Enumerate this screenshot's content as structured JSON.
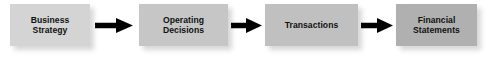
{
  "figure": {
    "type": "process-flow-diagram",
    "orientation": "left-to-right",
    "background_color": "#ffffff",
    "text_color": "#111111",
    "arrow_color": "#000000",
    "shadow_color": "#c9c9c9"
  },
  "nodes": [
    {
      "id": "business-strategy",
      "label": "Business\nStrategy",
      "line1": "Business",
      "line2": "Strategy",
      "fill_color": "#d4d4d4",
      "x": 10,
      "y": 4,
      "width": 80,
      "height": 42
    },
    {
      "id": "operating-decisions",
      "label": "Operating\nDecisions",
      "line1": "Operating",
      "line2": "Decisions",
      "fill_color": "#c6c6c6",
      "x": 139,
      "y": 4,
      "width": 89,
      "height": 42
    },
    {
      "id": "transactions",
      "label": "Transactions",
      "line1": "Transactions",
      "line2": "",
      "fill_color": "#c0c0c0",
      "x": 265,
      "y": 4,
      "width": 93,
      "height": 42
    },
    {
      "id": "financial-statements",
      "label": "Financial\nStatements",
      "line1": "Financial",
      "line2": "Statements",
      "fill_color": "#b0b0b0",
      "x": 396,
      "y": 4,
      "width": 81,
      "height": 42
    }
  ],
  "arrows": [
    {
      "id": "arrow-1",
      "from": "business-strategy",
      "to": "operating-decisions",
      "x": 95,
      "y": 18,
      "width": 38,
      "height": 15
    },
    {
      "id": "arrow-2",
      "from": "operating-decisions",
      "to": "transactions",
      "x": 231,
      "y": 18,
      "width": 31,
      "height": 15
    },
    {
      "id": "arrow-3",
      "from": "transactions",
      "to": "financial-statements",
      "x": 361,
      "y": 18,
      "width": 32,
      "height": 15
    }
  ]
}
